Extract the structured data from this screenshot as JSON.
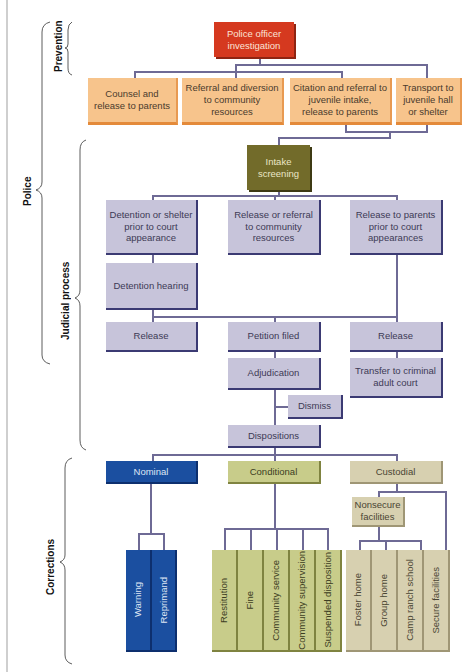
{
  "caption_cut": "Juvenile justice system process",
  "side_labels": {
    "prevention": "Prevention",
    "police": "Police",
    "judicial": "Judicial process",
    "corrections": "Corrections"
  },
  "prevention": {
    "top": "Police officer investigation",
    "options": [
      "Counsel and release to parents",
      "Referral and diversion to community resources",
      "Citation and referral to juvenile intake, release to parents",
      "Transport to juvenile hall or shelter"
    ]
  },
  "judicial": {
    "intake": "Intake screening",
    "row1": [
      "Detention or shelter prior to court appearance",
      "Release or referral to community resources",
      "Release to parents prior to court appearances"
    ],
    "detention_hearing": "Detention hearing",
    "row2": [
      "Release",
      "Petition filed",
      "Release"
    ],
    "adjudication": "Adjudication",
    "transfer": "Transfer to criminal adult court",
    "dismiss": "Dismiss",
    "dispositions": "Dispositions"
  },
  "corrections": {
    "nominal": {
      "label": "Nominal",
      "items": [
        "Warning",
        "Reprimand"
      ]
    },
    "conditional": {
      "label": "Conditional",
      "items": [
        "Restitution",
        "Fine",
        "Community service",
        "Community supervision",
        "Suspended disposition"
      ]
    },
    "custodial": {
      "label": "Custodial",
      "nonsecure": "Nonsecure facilities",
      "items": [
        "Foster home",
        "Group home",
        "Camp ranch school",
        "Secure facilities"
      ]
    }
  },
  "colors": {
    "police_officer": "#d5391f",
    "prevention_options": "#f7c48c",
    "intake": "#726b2a",
    "judicial_boxes": "#c7c4da",
    "nominal": "#1b4fa0",
    "conditional": "#c8cc8a",
    "custodial": "#d7d0b0",
    "connector": "#6e6a95"
  }
}
